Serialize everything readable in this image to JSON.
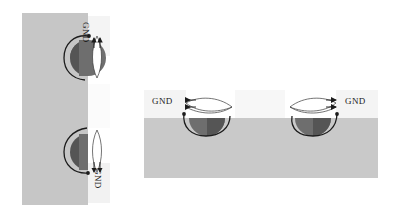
{
  "figure": {
    "background_color": "#ffffff"
  },
  "palette": {
    "substrate_gray": "#c6c6c6",
    "substrate_gray_right": "#c9c9c9",
    "oxide_white": "#ffffff",
    "oxide_light": "#f4f4f4",
    "dome_dark": "#555555",
    "dome_mid": "#6e6e6e",
    "stroke_dark": "#1c1c1c",
    "stroke_thin": "#3a3a3a"
  },
  "left_panel": {
    "name": "rotated-cross-section",
    "orientation": "rotated-90",
    "substrate": {
      "x": 22,
      "y": 13,
      "width": 66,
      "height": 192
    },
    "oxide_strip": {
      "x": 88,
      "y": 13,
      "width": 20,
      "height": 192
    },
    "labels": [
      {
        "id": "gnd-left-top",
        "text": "GND",
        "rotation": 90
      },
      {
        "id": "gnd-left-bottom",
        "text": "GND",
        "rotation": 90
      }
    ],
    "contacts": [
      {
        "id": "contact-top",
        "center_y": 58
      },
      {
        "id": "contact-bottom",
        "center_y": 152
      }
    ]
  },
  "right_panel": {
    "name": "standard-cross-section",
    "orientation": "horizontal",
    "substrate": {
      "x": 144,
      "y": 118,
      "width": 234,
      "height": 60
    },
    "oxide_band": {
      "x": 144,
      "y": 88,
      "width": 234,
      "height": 30
    },
    "labels": [
      {
        "id": "gnd-right-left",
        "text": "GND",
        "rotation": 0
      },
      {
        "id": "gnd-right-right",
        "text": "GND",
        "rotation": 0
      }
    ],
    "contacts": [
      {
        "id": "contact-left",
        "center_x": 207
      },
      {
        "id": "contact-right",
        "center_x": 313
      }
    ]
  },
  "annotations": {
    "arrow_count_per_label": 2,
    "curve_style": "current-flow-arc",
    "arrowhead": "solid-triangle"
  }
}
